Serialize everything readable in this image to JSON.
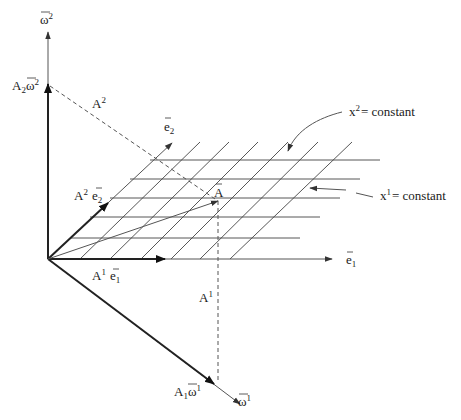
{
  "diagram": {
    "labels": {
      "omega2_axis": "ω",
      "omega2_axis_sup": "2",
      "omega1_axis": "ω",
      "omega1_axis_sup": "1",
      "A2_omega2_coef": "A",
      "A2_omega2_coef_sub": "2",
      "A2_omega2_vec": "ω",
      "A2_omega2_vec_sup": "2",
      "A1_omega1_coef": "A",
      "A1_omega1_coef_sub": "1",
      "A1_omega1_vec": "ω",
      "A1_omega1_vec_sup": "1",
      "A_super2": "A",
      "A_super2_sup": "2",
      "A_super1": "A",
      "A_super1_sup": "1",
      "e2": "e",
      "e2_sub": "2",
      "e1": "e",
      "e1_sub": "1",
      "A2_e2_coef": "A",
      "A2_e2_coef_sup": "2",
      "A2_e2_vec": "e",
      "A2_e2_vec_sub": "2",
      "A1_e1_coef": "A",
      "A1_e1_coef_sup": "1",
      "A1_e1_vec": "e",
      "A1_e1_vec_sub": "1",
      "vector_A": "A",
      "x2_const": "x",
      "x2_const_sup": "2",
      "x2_const_rest": "= constant",
      "x1_const": "x",
      "x1_const_sup": "1",
      "x1_const_rest": "= constant"
    },
    "elements": [
      "omega-2 axis (vertical)",
      "omega-1 axis (diagonal down-right)",
      "e1 basis vector (horizontal)",
      "e2 basis vector (diagonal up-right)",
      "coordinate grid: x1 = constant lines (slanted) and x2 = constant lines (horizontal)",
      "vector A from origin",
      "dashed projection lines A1 and A2"
    ]
  }
}
